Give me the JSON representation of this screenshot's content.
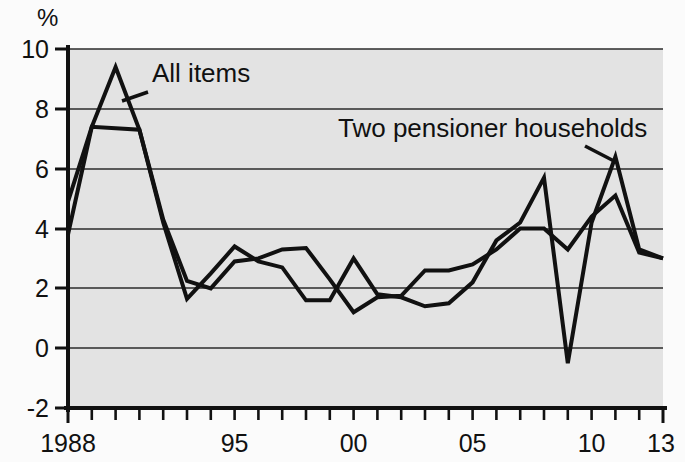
{
  "chart_data": {
    "type": "line",
    "title": "",
    "subtitle": "",
    "xlabel": "",
    "ylabel": "%",
    "y_unit_symbol": "%",
    "xlim": [
      1988,
      2013
    ],
    "ylim": [
      -2,
      10
    ],
    "y_ticks": [
      -2,
      0,
      2,
      4,
      6,
      8,
      10
    ],
    "y_tick_labels": [
      "-2",
      "0",
      "2",
      "4",
      "6",
      "8",
      "10"
    ],
    "x_ticks": [
      1988,
      1995,
      2000,
      2005,
      2010,
      2013
    ],
    "x_tick_labels": [
      "1988",
      "95",
      "00",
      "05",
      "10",
      "13"
    ],
    "x_minor_ticks_every": 1,
    "grid": true,
    "grid_axis": "y",
    "legend_position": "inline-annotations",
    "x": [
      1988,
      1989,
      1990,
      1991,
      1992,
      1993,
      1994,
      1995,
      1996,
      1997,
      1998,
      1999,
      2000,
      2001,
      2002,
      2003,
      2004,
      2005,
      2006,
      2007,
      2008,
      2009,
      2010,
      2011,
      2012,
      2013
    ],
    "series": [
      {
        "name": "All items",
        "label": "All items",
        "color": "#111111",
        "values": [
          3.8,
          7.4,
          9.4,
          7.3,
          4.2,
          1.65,
          2.5,
          3.4,
          2.9,
          2.7,
          1.6,
          1.6,
          3.0,
          1.8,
          1.7,
          1.4,
          1.5,
          2.2,
          3.6,
          4.2,
          5.7,
          -0.5,
          4.2,
          6.4,
          3.3,
          3.0
        ],
        "annotation": {
          "text": "All items",
          "pointer_target_x": 1990,
          "pointer_target_y": 8.7
        }
      },
      {
        "name": "Two pensioner households",
        "label": "Two pensioner households",
        "color": "#111111",
        "values": [
          4.9,
          7.4,
          7.35,
          7.3,
          4.3,
          2.25,
          2.0,
          2.9,
          3.0,
          3.3,
          3.35,
          2.3,
          1.2,
          1.7,
          1.75,
          2.6,
          2.6,
          2.8,
          3.3,
          4.0,
          4.0,
          3.3,
          4.4,
          5.1,
          3.2,
          3.0
        ],
        "annotation": {
          "text": "Two pensioner households",
          "pointer_target_x": 2011,
          "pointer_target_y": 6.2
        }
      }
    ],
    "annotations": [
      {
        "name": "all-items-label",
        "text": "All items"
      },
      {
        "name": "two-pensioner-label",
        "text": "Two pensioner households"
      }
    ],
    "colors": {
      "plot_background": "#e3e3e3",
      "page_background": "#fbfbfb",
      "line": "#111111",
      "grid": "#2b2b2b",
      "axis": "#111111",
      "text": "#111111"
    }
  },
  "labels": {
    "y_unit": "%",
    "y0": "10",
    "y1": "8",
    "y2": "6",
    "y3": "4",
    "y4": "2",
    "y5": "0",
    "y6": "-2",
    "x0": "1988",
    "x1": "95",
    "x2": "00",
    "x3": "05",
    "x4": "10",
    "x5": "13",
    "series_all_items": "All items",
    "series_two_pensioner": "Two pensioner households"
  }
}
